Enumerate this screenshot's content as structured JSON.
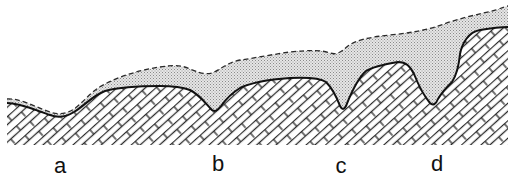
{
  "figure": {
    "colors": {
      "background": "#ffffff",
      "line": "#1a1a1a",
      "stipple": "#c8c8c8",
      "hatch": "#2a2a2a"
    },
    "layers": [
      {
        "name": "cover-layer",
        "fill": "stippled",
        "top_boundary": "dashed"
      },
      {
        "name": "limestone-bedrock",
        "fill": "brick-hatch",
        "top_boundary": "solid"
      }
    ],
    "labels": [
      {
        "id": "a",
        "text": "a",
        "x": 60
      },
      {
        "id": "b",
        "text": "b",
        "x": 218
      },
      {
        "id": "c",
        "text": "c",
        "x": 341
      },
      {
        "id": "d",
        "text": "d",
        "x": 437
      }
    ]
  }
}
